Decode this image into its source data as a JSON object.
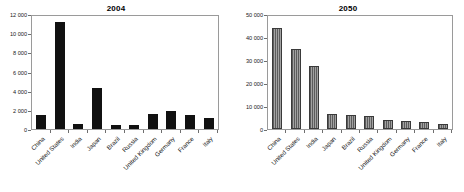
{
  "chart_data": [
    {
      "type": "bar",
      "title": "2004",
      "xlabel": "",
      "ylabel": "",
      "ylim": [
        0,
        12000
      ],
      "ytick_labels": [
        "12 000",
        "10 000",
        "8 000",
        "6 000",
        "4 000",
        "2 000",
        "0"
      ],
      "yticks": [
        12000,
        10000,
        8000,
        6000,
        4000,
        2000,
        0
      ],
      "grid": false,
      "legend": "none",
      "bar_style": "solid-black",
      "bar_color": "#111111",
      "categories": [
        "China",
        "United States",
        "India",
        "Japan",
        "Brazil",
        "Russia",
        "United Kingdom",
        "Germany",
        "France",
        "Italy"
      ],
      "values": [
        1530,
        11370,
        545,
        4380,
        400,
        470,
        1640,
        1950,
        1450,
        1220
      ]
    },
    {
      "type": "bar",
      "title": "2050",
      "xlabel": "",
      "ylabel": "",
      "ylim": [
        0,
        50000
      ],
      "ytick_labels": [
        "50 000",
        "40 000",
        "30 000",
        "20 000",
        "10 000",
        "0"
      ],
      "yticks": [
        50000,
        40000,
        30000,
        20000,
        10000,
        0
      ],
      "grid": false,
      "legend": "none",
      "bar_style": "gray-hatched",
      "bar_color": "#8b8b8b",
      "categories": [
        "China",
        "United States",
        "India",
        "Japan",
        "Brazil",
        "Russia",
        "United Kingdom",
        "Germany",
        "France",
        "Italy"
      ],
      "values": [
        44850,
        35450,
        27800,
        6700,
        6100,
        5900,
        3800,
        3600,
        3150,
        2100
      ]
    }
  ]
}
